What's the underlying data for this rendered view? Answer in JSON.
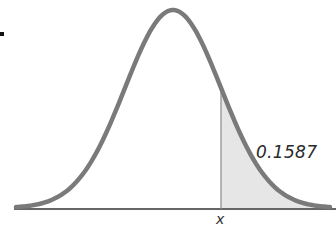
{
  "chart_data": {
    "type": "area",
    "title": "",
    "distribution": "normal",
    "mean": 0,
    "sd": 1,
    "shaded_region": {
      "from": "x",
      "to": "+inf",
      "area": 0.1587
    },
    "annotations": [
      {
        "text": "0.1587",
        "role": "shaded-area-probability"
      },
      {
        "text": "x",
        "role": "cutoff-label-on-axis"
      }
    ],
    "xlabel": "",
    "ylabel": "",
    "grid": false,
    "legend": null
  },
  "labels": {
    "area": "0.1587",
    "cutoff": "x"
  },
  "colors": {
    "curve": "#7a7a7a",
    "shade": "#e6e6e6",
    "axis": "#333333",
    "cutoff_line": "#8a8a8a"
  }
}
